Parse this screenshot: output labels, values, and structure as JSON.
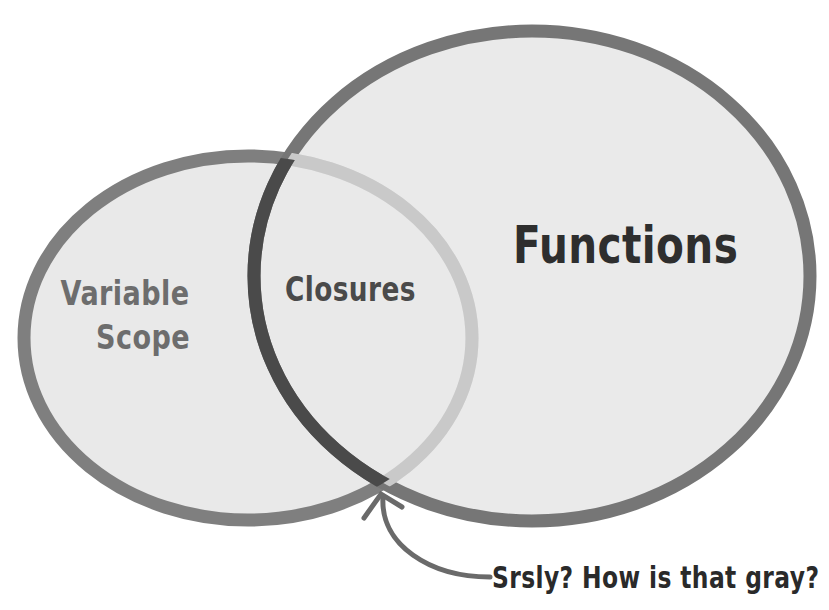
{
  "diagram": {
    "type": "venn",
    "sets": [
      {
        "id": "variable-scope",
        "label_line1": "Variable",
        "label_line2": "Scope"
      },
      {
        "id": "functions",
        "label": "Functions"
      }
    ],
    "intersection": {
      "label": "Closures"
    },
    "annotation": {
      "text": "Srsly? How is that gray?",
      "points_to": "intersection-border"
    }
  },
  "colors": {
    "background": "#ffffff",
    "fill": "#e8e8e8",
    "left_stroke": "#7f7f7f",
    "right_stroke": "#767676",
    "overlap_dark_stroke": "#4a4a4a",
    "overlap_light_stroke": "#c9c9c9",
    "arrow": "#6a6a6a"
  }
}
